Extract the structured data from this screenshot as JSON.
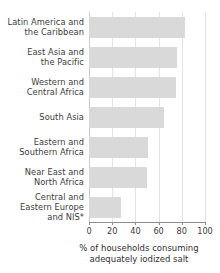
{
  "chart_data": {
    "type": "bar",
    "orientation": "horizontal",
    "title": "",
    "xlabel": "% of households consuming adequately iodized salt",
    "ylabel": "",
    "xlim": [
      0,
      100
    ],
    "grid": true,
    "legend": "none",
    "categories": [
      "Latin America and the Caribbean",
      "East Asia and the Pacific",
      "Western and Central Africa",
      "South Asia",
      "Eastern and Southern Africa",
      "Near East and North Africa",
      "Central and Eastern Europe and NIS*"
    ],
    "values": [
      83,
      76,
      75,
      65,
      51,
      50,
      28
    ],
    "xticks": [
      0,
      20,
      40,
      60,
      80,
      100
    ],
    "xtick_labels": [
      "0",
      "20",
      "40",
      "60",
      "80",
      "100"
    ],
    "bar_color": "#d9d9d9",
    "gridline_color": "#e2e2e2",
    "axis_color": "#8d8d8d"
  },
  "category_label_lines": [
    [
      "Latin America and",
      "the Caribbean"
    ],
    [
      "East Asia and",
      "the Pacific"
    ],
    [
      "Western and",
      "Central Africa"
    ],
    [
      "South Asia"
    ],
    [
      "Eastern and",
      "Southern Africa"
    ],
    [
      "Near East and",
      "North Africa"
    ],
    [
      "Central and",
      "Eastern Europe",
      "and NIS*"
    ]
  ],
  "axis_title_lines": [
    "% of households consuming",
    "adequately iodized salt"
  ]
}
